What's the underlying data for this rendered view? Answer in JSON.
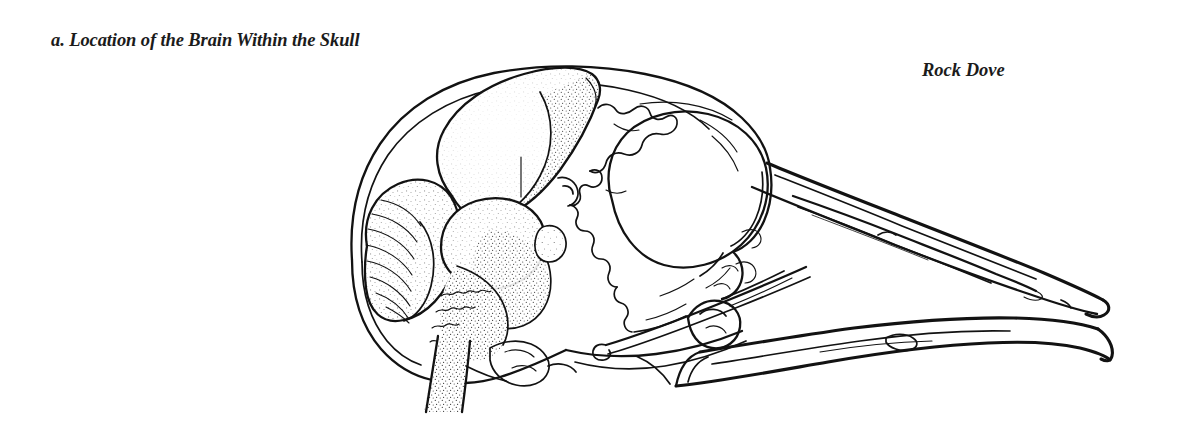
{
  "figure": {
    "caption": "a. Location of the Brain Within the Skull",
    "species_label": "Rock Dove",
    "background_color": "#ffffff",
    "ink_color": "#121212",
    "text_color": "#1b1b1b"
  },
  "illustration": {
    "subject": "bird-skull-sagittal-section-with-brain",
    "style": "pen-and-ink line drawing with stipple shading",
    "parts": [
      {
        "name": "cranium-outline",
        "label": "cranium"
      },
      {
        "name": "cerebrum",
        "label": "cerebrum",
        "shading": "stipple"
      },
      {
        "name": "cerebellum",
        "label": "cerebellum",
        "shading": "stipple",
        "folia": 9
      },
      {
        "name": "optic-lobe",
        "label": "optic lobe",
        "shading": "stipple"
      },
      {
        "name": "brainstem",
        "label": "brain stem",
        "shading": "stipple"
      },
      {
        "name": "spinal-cord",
        "label": "spinal cord",
        "shading": "stipple"
      },
      {
        "name": "orbit",
        "label": "orbital cavity"
      },
      {
        "name": "interorbital-septum",
        "label": "interorbital septum"
      },
      {
        "name": "upper-mandible",
        "label": "upper mandible"
      },
      {
        "name": "lower-mandible",
        "label": "lower mandible"
      },
      {
        "name": "naris",
        "label": "naris"
      },
      {
        "name": "jugal-bar",
        "label": "jugal bar"
      },
      {
        "name": "quadrate",
        "label": "quadrate"
      },
      {
        "name": "palatine",
        "label": "palatine"
      },
      {
        "name": "occipital-condyle",
        "label": "occipital condyle"
      }
    ]
  }
}
